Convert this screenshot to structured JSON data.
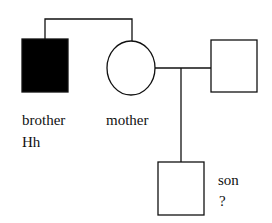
{
  "diagram": {
    "type": "pedigree",
    "individuals": [
      {
        "id": "brother",
        "label": "brother",
        "genotype": "Hh",
        "sex": "male",
        "affected": true
      },
      {
        "id": "mother",
        "label": "mother",
        "sex": "female",
        "affected": false
      },
      {
        "id": "father",
        "label": "",
        "sex": "male",
        "affected": false
      },
      {
        "id": "son",
        "label": "son",
        "genotype": "?",
        "sex": "male",
        "affected": false
      }
    ],
    "relations": [
      {
        "type": "siblings",
        "members": [
          "brother",
          "mother"
        ]
      },
      {
        "type": "mating",
        "members": [
          "mother",
          "father"
        ]
      },
      {
        "type": "offspring",
        "parents": [
          "mother",
          "father"
        ],
        "child": "son"
      }
    ],
    "colors": {
      "line": "#111111",
      "affected_fill": "#000000",
      "unaffected_fill": "#ffffff"
    }
  }
}
